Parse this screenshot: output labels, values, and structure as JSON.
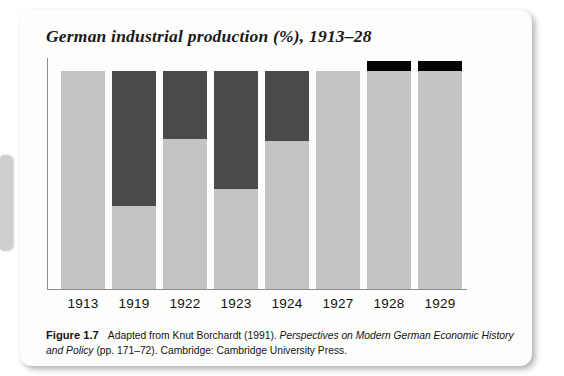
{
  "card": {
    "title": "German industrial production (%), 1913–28"
  },
  "left_tab": {
    "name": "page-edge-tab",
    "color": "#cfcfcf"
  },
  "caption": {
    "label": "Figure 1.7",
    "text_before_italic": "Adapted from Knut Borchardt (1991). ",
    "italic_title": "Perspectives on Modern German Economic History and Policy",
    "text_after_italic": " (pp. 171–72). Cambridge: Cambridge University Press."
  },
  "colors": {
    "light_gray": "#c4c4c4",
    "dark_gray": "#4a4a4a",
    "black_cap": "#050505",
    "axis": "#8d8d8d",
    "card_background": "#fdfdfc",
    "title_text": "#1a1a1a"
  },
  "chart_data": {
    "type": "bar",
    "title": "German industrial production (%), 1913–28",
    "xlabel": "",
    "ylabel": "",
    "ylim": [
      0,
      100
    ],
    "grid": false,
    "legend": "none",
    "note": "Stacked single-column-per-year bars of equal total height; the dark upper segment marks the shortfall below the 1913 baseline, and the black cap above the baseline marks production exceeding it.",
    "categories": [
      "1913",
      "1919",
      "1922",
      "1923",
      "1924",
      "1927",
      "1928",
      "1929"
    ],
    "series": [
      {
        "name": "Production achieved (light gray)",
        "values": [
          100,
          38,
          69,
          46,
          68,
          100,
          100,
          100
        ]
      },
      {
        "name": "Shortfall below 1913 level (dark gray)",
        "values": [
          0,
          62,
          31,
          54,
          32,
          0,
          0,
          0
        ]
      },
      {
        "name": "Excess above 1913 level (black cap)",
        "values": [
          0,
          0,
          0,
          0,
          0,
          0,
          5,
          5
        ]
      }
    ],
    "bars": [
      {
        "year": "1913",
        "light_pct": 100,
        "dark_pct": 0,
        "cap": false
      },
      {
        "year": "1919",
        "light_pct": 38,
        "dark_pct": 62,
        "cap": false
      },
      {
        "year": "1922",
        "light_pct": 69,
        "dark_pct": 31,
        "cap": false
      },
      {
        "year": "1923",
        "light_pct": 46,
        "dark_pct": 54,
        "cap": false
      },
      {
        "year": "1924",
        "light_pct": 68,
        "dark_pct": 32,
        "cap": false
      },
      {
        "year": "1927",
        "light_pct": 100,
        "dark_pct": 0,
        "cap": false
      },
      {
        "year": "1928",
        "light_pct": 100,
        "dark_pct": 0,
        "cap": true
      },
      {
        "year": "1929",
        "light_pct": 100,
        "dark_pct": 0,
        "cap": true
      }
    ]
  }
}
